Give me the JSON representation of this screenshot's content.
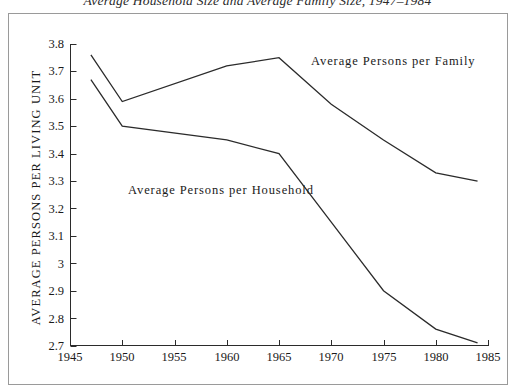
{
  "chart_data": {
    "type": "line",
    "title": "Average Household Size and Average Family Size, 1947–1984",
    "xlabel": "",
    "ylabel": "AVERAGE PERSONS PER LIVING UNIT",
    "xlim": [
      1945,
      1985
    ],
    "ylim": [
      2.7,
      3.8
    ],
    "xticks": [
      1945,
      1950,
      1955,
      1960,
      1965,
      1970,
      1975,
      1980,
      1985
    ],
    "xtick_labels": [
      "1945",
      "1950",
      "1955",
      "1960",
      "1965",
      "1970",
      "1975",
      "1980",
      "1985"
    ],
    "yticks": [
      2.7,
      2.8,
      2.9,
      3.0,
      3.1,
      3.2,
      3.3,
      3.4,
      3.5,
      3.6,
      3.7,
      3.8
    ],
    "ytick_labels": [
      "2.7",
      "2.8",
      "2.9",
      "3",
      "3.1",
      "3.2",
      "3.3",
      "3.4",
      "3.5",
      "3.6",
      "3.7",
      "3.8"
    ],
    "grid": false,
    "legend": "inline-annotations",
    "line_color": "#2b2b2b",
    "series": [
      {
        "name": "Average Persons per Family",
        "x": [
          1947,
          1950,
          1960,
          1965,
          1970,
          1975,
          1980,
          1984
        ],
        "values": [
          3.76,
          3.59,
          3.72,
          3.75,
          3.58,
          3.45,
          3.33,
          3.3
        ]
      },
      {
        "name": "Average Persons per Household",
        "x": [
          1947,
          1950,
          1960,
          1965,
          1970,
          1975,
          1980,
          1984
        ],
        "values": [
          3.67,
          3.5,
          3.45,
          3.4,
          3.15,
          2.9,
          2.76,
          2.71
        ]
      }
    ],
    "annotations": [
      {
        "text": "Average Persons per Family",
        "x": 1968.0,
        "y": 3.72
      },
      {
        "text": "Average Persons per Household",
        "x": 1950.5,
        "y": 3.26
      }
    ]
  }
}
